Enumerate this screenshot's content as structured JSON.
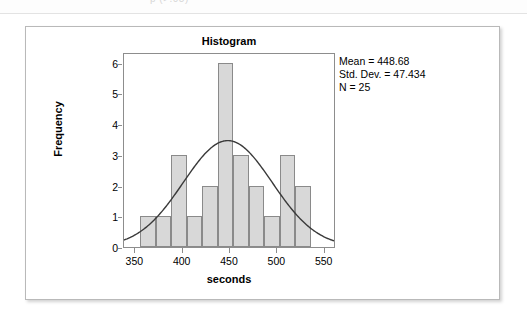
{
  "page": {
    "top_partial_text": "p (>.05)"
  },
  "chart_data": {
    "type": "bar",
    "title": "Histogram",
    "xlabel": "seconds",
    "ylabel": "Frequency",
    "xlim": [
      338,
      562
    ],
    "ylim": [
      0,
      6.35
    ],
    "x_ticks": [
      "350",
      "400",
      "450",
      "500",
      "550"
    ],
    "x_tick_values": [
      350,
      400,
      450,
      500,
      550
    ],
    "y_ticks": [
      "0",
      "1",
      "2",
      "3",
      "4",
      "5",
      "6"
    ],
    "y_tick_values": [
      0,
      1,
      2,
      3,
      4,
      5,
      6
    ],
    "grid": false,
    "legend": "none",
    "bin_width": 16.4,
    "bin_starts": [
      355.0,
      371.4,
      387.8,
      404.2,
      420.6,
      437.0,
      453.4,
      469.8,
      486.2,
      502.6,
      519.0
    ],
    "bin_ends": [
      371.4,
      387.8,
      404.2,
      420.6,
      437.0,
      453.4,
      469.8,
      486.2,
      502.6,
      519.0,
      535.4
    ],
    "categories": [
      "355-371",
      "371-388",
      "388-404",
      "404-421",
      "421-437",
      "437-453",
      "453-470",
      "470-486",
      "486-503",
      "503-519",
      "519-535"
    ],
    "values": [
      1,
      1,
      3,
      1,
      2,
      6,
      3,
      2,
      1,
      3,
      2
    ],
    "overlay": {
      "type": "normal-curve",
      "mean": 448.68,
      "std_dev": 47.434,
      "n": 25,
      "peak_height": 3.5
    },
    "annotations": {
      "mean": "Mean = 448.68",
      "std_dev": "Std. Dev. = 47.434",
      "n": "N = 25"
    },
    "colors": {
      "bar_fill": "#d8d8d8",
      "bar_edge": "#8a8a8a",
      "curve": "#3a3a3a",
      "axis": "#8d8d8d",
      "text": "#000000",
      "card_border": "#b9b9b9"
    }
  }
}
